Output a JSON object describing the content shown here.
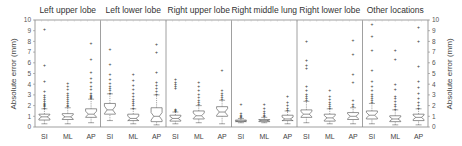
{
  "chart_data": {
    "type": "box",
    "ylabel_left": "Absolute error (mm)",
    "ylabel_right": "Absolute error (mm)",
    "ylim": [
      0,
      10
    ],
    "yticks": [
      0,
      1,
      2,
      3,
      4,
      5,
      6,
      7,
      8,
      9,
      10
    ],
    "grid": false,
    "categories": [
      "SI",
      "ML",
      "AP"
    ],
    "panels": [
      {
        "title": "Left upper lobe",
        "boxes": [
          {
            "cat": "SI",
            "whislo": 0.3,
            "q1": 0.65,
            "med": 0.95,
            "q3": 1.2,
            "whishi": 1.7,
            "fliers": [
              1.8,
              1.9,
              2.0,
              2.1,
              2.2,
              2.4,
              2.6,
              2.8,
              3.0,
              3.3,
              4.3,
              5.8,
              9.1
            ]
          },
          {
            "cat": "ML",
            "whislo": 0.3,
            "q1": 0.7,
            "med": 0.95,
            "q3": 1.25,
            "whishi": 1.8,
            "fliers": [
              1.9,
              2.0,
              2.2,
              2.4,
              2.6,
              2.8,
              3.0,
              3.2,
              3.5,
              3.8,
              4.1
            ]
          },
          {
            "cat": "AP",
            "whislo": 0.4,
            "q1": 0.9,
            "med": 1.2,
            "q3": 1.7,
            "whishi": 2.6,
            "fliers": [
              2.7,
              2.8,
              2.9,
              3.0,
              3.2,
              3.5,
              3.8,
              4.2,
              4.6,
              5.1,
              6.3,
              7.8
            ]
          }
        ]
      },
      {
        "title": "Left lower lobe",
        "boxes": [
          {
            "cat": "SI",
            "whislo": 0.6,
            "q1": 1.2,
            "med": 1.6,
            "q3": 2.2,
            "whishi": 3.1,
            "fliers": [
              3.2,
              3.4,
              3.6,
              3.8,
              4.1,
              4.5,
              4.9,
              5.9,
              7.3
            ]
          },
          {
            "cat": "ML",
            "whislo": 0.3,
            "q1": 0.6,
            "med": 0.8,
            "q3": 1.2,
            "whishi": 1.7,
            "fliers": [
              1.8,
              2.0,
              2.2,
              2.4,
              2.6,
              2.9,
              3.2,
              3.5,
              3.9,
              4.4,
              4.9
            ]
          },
          {
            "cat": "AP",
            "whislo": 0.2,
            "q1": 0.5,
            "med": 1.0,
            "q3": 1.8,
            "whishi": 3.0,
            "fliers": [
              3.1,
              3.3,
              3.6,
              3.9,
              4.2,
              5.1,
              7.0,
              7.7
            ]
          }
        ]
      },
      {
        "title": "Right upper lobe",
        "boxes": [
          {
            "cat": "SI",
            "whislo": 0.3,
            "q1": 0.55,
            "med": 0.8,
            "q3": 1.1,
            "whishi": 1.4,
            "fliers": [
              1.5,
              1.6,
              1.7,
              3.6,
              3.8,
              4.0,
              4.2,
              4.5
            ]
          },
          {
            "cat": "ML",
            "whislo": 0.4,
            "q1": 0.75,
            "med": 1.05,
            "q3": 1.5,
            "whishi": 2.0,
            "fliers": [
              2.1,
              2.3,
              2.5,
              2.8,
              3.1,
              3.4,
              3.8,
              4.2
            ]
          },
          {
            "cat": "AP",
            "whislo": 0.3,
            "q1": 1.0,
            "med": 1.4,
            "q3": 1.9,
            "whishi": 2.5,
            "fliers": [
              2.6,
              2.8,
              3.0,
              3.2,
              3.4,
              5.3
            ]
          }
        ]
      },
      {
        "title": "Right middle lung",
        "boxes": [
          {
            "cat": "SI",
            "whislo": 0.4,
            "q1": 0.5,
            "med": 0.55,
            "q3": 0.65,
            "whishi": 0.8,
            "fliers": [
              0.9,
              1.0,
              1.1,
              1.3,
              2.1
            ]
          },
          {
            "cat": "ML",
            "whislo": 0.4,
            "q1": 0.5,
            "med": 0.6,
            "q3": 0.7,
            "whishi": 0.9,
            "fliers": [
              1.0,
              1.1,
              1.3,
              1.5,
              1.8,
              2.1
            ]
          },
          {
            "cat": "AP",
            "whislo": 0.3,
            "q1": 0.6,
            "med": 0.75,
            "q3": 1.1,
            "whishi": 1.5,
            "fliers": [
              1.6,
              1.8,
              2.0,
              2.3,
              2.9
            ]
          }
        ]
      },
      {
        "title": "Right lower lobe",
        "boxes": [
          {
            "cat": "SI",
            "whislo": 0.4,
            "q1": 0.9,
            "med": 1.2,
            "q3": 1.6,
            "whishi": 2.4,
            "fliers": [
              2.5,
              2.7,
              2.9,
              3.1,
              3.4,
              3.8,
              5.5,
              5.8,
              6.2,
              8.0
            ]
          },
          {
            "cat": "ML",
            "whislo": 0.3,
            "q1": 0.55,
            "med": 0.85,
            "q3": 1.2,
            "whishi": 1.7,
            "fliers": [
              1.8,
              1.9,
              2.1,
              2.3,
              2.6,
              2.9,
              3.4
            ]
          },
          {
            "cat": "AP",
            "whislo": 0.3,
            "q1": 0.7,
            "med": 1.0,
            "q3": 1.35,
            "whishi": 1.8,
            "fliers": [
              1.9,
              2.1,
              2.5,
              4.2,
              4.9,
              6.8,
              8.1
            ]
          }
        ]
      },
      {
        "title": "Other locations",
        "boxes": [
          {
            "cat": "SI",
            "whislo": 0.3,
            "q1": 0.75,
            "med": 1.1,
            "q3": 1.5,
            "whishi": 2.2,
            "fliers": [
              2.3,
              2.5,
              2.7,
              2.9,
              3.1,
              3.4,
              3.8,
              4.3,
              5.3,
              7.2,
              8.5,
              9.6
            ]
          },
          {
            "cat": "ML",
            "whislo": 0.2,
            "q1": 0.5,
            "med": 0.75,
            "q3": 1.05,
            "whishi": 1.6,
            "fliers": [
              1.7,
              1.9,
              2.1,
              2.4,
              2.7,
              2.9,
              3.5,
              4.0,
              6.3,
              7.2
            ]
          },
          {
            "cat": "AP",
            "whislo": 0.2,
            "q1": 0.6,
            "med": 0.9,
            "q3": 1.2,
            "whishi": 1.7,
            "fliers": [
              1.8,
              2.0,
              2.3,
              2.7,
              3.2,
              3.7,
              4.3,
              5.7,
              8.0,
              9.3
            ]
          }
        ]
      }
    ]
  }
}
